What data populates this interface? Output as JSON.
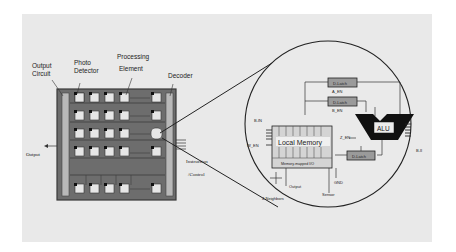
{
  "figure": {
    "left_chip": {
      "labels": {
        "output_circuit_1": "Output",
        "output_circuit_2": "Circuit",
        "photo_detector_1": "Photo",
        "photo_detector_2": "Detector",
        "processing_element_1": "Processing",
        "processing_element_2": "Element",
        "decoder": "Decoder",
        "output": "Output",
        "instruction_1": "Instruction",
        "instruction_2": "/Control"
      },
      "grid": {
        "rows": 5,
        "cols": 5
      }
    },
    "detail_view": {
      "labels": {
        "d_latch_a": "D-Latch",
        "a_en": "A_EN",
        "d_latch_b": "D-Latch",
        "b_en": "B_EN",
        "alu": "ALU",
        "local_memory": "Local Memory",
        "memory_mapped_io": "Memory-mapped I/O",
        "d_latch_z": "D-Latch",
        "z_en": "Z_EN",
        "w_en": "W_EN",
        "bit_in": "B-IN",
        "bit_out": "B-II",
        "output": "Output",
        "gnd": "GND",
        "sensor": "Sensor",
        "neighbors": "4-Neighbors"
      }
    }
  }
}
